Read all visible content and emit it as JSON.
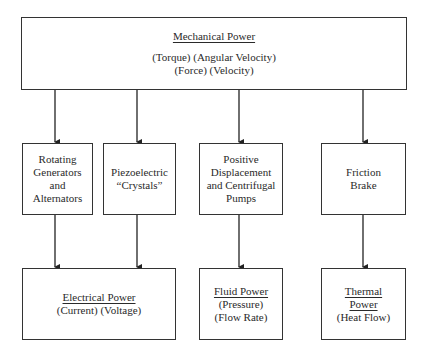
{
  "diagram": {
    "source": {
      "title": "Mechanical Power",
      "lines": [
        "(Torque) (Angular Velocity)",
        "(Force) (Velocity)"
      ]
    },
    "converters": [
      {
        "lines": [
          "Rotating",
          "Generators",
          "and",
          "Alternators"
        ]
      },
      {
        "lines": [
          "Piezoelectric",
          "“Crystals”"
        ]
      },
      {
        "lines": [
          "Positive",
          "Displacement",
          "and Centrifugal",
          "Pumps"
        ]
      },
      {
        "lines": [
          "Friction",
          "Brake"
        ]
      }
    ],
    "outputs": [
      {
        "title": [
          "Electrical Power"
        ],
        "lines": [
          "(Current) (Voltage)"
        ]
      },
      {
        "title": [
          "Fluid Power"
        ],
        "lines": [
          "(Pressure)",
          "(Flow Rate)"
        ]
      },
      {
        "title": [
          "Thermal",
          "Power"
        ],
        "lines": [
          "(Heat Flow)"
        ]
      }
    ],
    "edges": [
      {
        "from": "Mechanical Power",
        "to": "Rotating Generators and Alternators"
      },
      {
        "from": "Mechanical Power",
        "to": "Piezoelectric Crystals"
      },
      {
        "from": "Mechanical Power",
        "to": "Positive Displacement and Centrifugal Pumps"
      },
      {
        "from": "Mechanical Power",
        "to": "Friction Brake"
      },
      {
        "from": "Rotating Generators and Alternators",
        "to": "Electrical Power"
      },
      {
        "from": "Piezoelectric Crystals",
        "to": "Electrical Power"
      },
      {
        "from": "Positive Displacement and Centrifugal Pumps",
        "to": "Fluid Power"
      },
      {
        "from": "Friction Brake",
        "to": "Thermal Power"
      }
    ]
  }
}
